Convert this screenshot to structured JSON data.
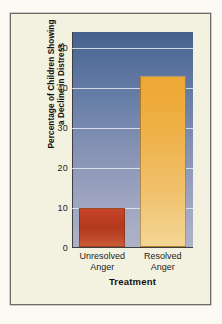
{
  "figure": {
    "background_color": "#fbfbf4",
    "card_color": "#f3f1df",
    "frame_color": "#6d6c66"
  },
  "chart_data": {
    "type": "bar",
    "title": "",
    "categories": [
      "Unresolved Anger",
      "Resolved Anger"
    ],
    "category_lines": [
      [
        "Unresolved",
        "Anger"
      ],
      [
        "Resolved",
        "Anger"
      ]
    ],
    "values": [
      10,
      43
    ],
    "series": [
      {
        "name": "Percentage of Children Showing a Decline in Distress",
        "values": [
          10,
          43
        ]
      }
    ],
    "xlabel": "Treatment",
    "ylabel": "Percentage of Children Showing a Decline in Distress",
    "ylabel_lines": [
      "Percentage of Children Showing",
      "a Decline in Distress"
    ],
    "ylim": [
      0,
      54
    ],
    "yticks": [
      0,
      10,
      20,
      30,
      40,
      50
    ],
    "ytick_labels": [
      "0",
      "10",
      "20",
      "30",
      "40",
      "50"
    ],
    "grid": true,
    "gridline_color": "#e8eaf0",
    "legend": null,
    "legend_position": "none",
    "bar_colors": [
      "#bf3f26",
      "#eeac3c"
    ],
    "plot_background_gradient": [
      "#47618f",
      "#aeb2c8"
    ]
  }
}
